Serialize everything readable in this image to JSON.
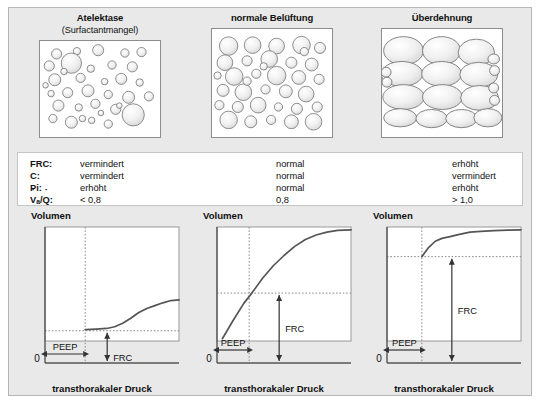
{
  "panels": [
    {
      "title": "Atelektase",
      "subtitle": "(Surfactantmangel)",
      "name": "atelectasis"
    },
    {
      "title": "normale Belüftung",
      "subtitle": "",
      "name": "normal-ventilation"
    },
    {
      "title": "Überdehnung",
      "subtitle": "",
      "name": "overdistension"
    }
  ],
  "table": {
    "rows": [
      {
        "label": "FRC:",
        "values": [
          "vermindert",
          "normal",
          "erhöht"
        ]
      },
      {
        "label": "C:",
        "values": [
          "vermindert",
          "normal",
          "vermindert"
        ]
      },
      {
        "label": "Pi:",
        "values": [
          "erhöht",
          "normal",
          "erhöht"
        ]
      },
      {
        "label": "Va/Q:",
        "values": [
          "< 0,8",
          "0,8",
          "> 1,0"
        ]
      }
    ],
    "ratio_label": {
      "v": "V",
      "a": "a",
      "slash": "/",
      "q": "Q",
      "colon": ":"
    }
  },
  "charts": [
    {
      "name": "pressure-volume-atelectasis",
      "ylabel": "Volumen",
      "xlabel": "transthorakaler Druck",
      "origin_label": "0",
      "peep_label": "PEEP",
      "frc_label": "FRC"
    },
    {
      "name": "pressure-volume-normal",
      "ylabel": "Volumen",
      "xlabel": "transthorakaler Druck",
      "origin_label": "0",
      "peep_label": "PEEP",
      "frc_label": "FRC"
    },
    {
      "name": "pressure-volume-overdistension",
      "ylabel": "Volumen",
      "xlabel": "transthorakaler Druck",
      "origin_label": "0",
      "peep_label": "PEEP",
      "frc_label": "FRC"
    }
  ],
  "chart_data": [
    {
      "type": "line",
      "title": "Atelektase",
      "xlabel": "transthorakaler Druck",
      "ylabel": "Volumen",
      "xlim": [
        0,
        1
      ],
      "ylim": [
        0,
        1
      ],
      "grid": false,
      "peep_x": 0.3,
      "frc_y": 0.09,
      "x": [
        0.3,
        0.38,
        0.46,
        0.52,
        0.58,
        0.64,
        0.7,
        0.76,
        0.82,
        0.88,
        0.94,
        1.0
      ],
      "y": [
        0.1,
        0.105,
        0.11,
        0.125,
        0.155,
        0.2,
        0.25,
        0.285,
        0.31,
        0.335,
        0.355,
        0.36
      ]
    },
    {
      "type": "line",
      "title": "normale Belüftung",
      "xlabel": "transthorakaler Druck",
      "ylabel": "Volumen",
      "xlim": [
        0,
        1
      ],
      "ylim": [
        0,
        1
      ],
      "grid": false,
      "peep_x": 0.24,
      "frc_y": 0.42,
      "x": [
        0.04,
        0.12,
        0.2,
        0.26,
        0.34,
        0.42,
        0.5,
        0.58,
        0.66,
        0.74,
        0.82,
        0.9,
        1.0
      ],
      "y": [
        0.02,
        0.18,
        0.33,
        0.42,
        0.55,
        0.66,
        0.75,
        0.83,
        0.89,
        0.93,
        0.955,
        0.97,
        0.975
      ]
    },
    {
      "type": "line",
      "title": "Überdehnung",
      "xlabel": "transthorakaler Druck",
      "ylabel": "Volumen",
      "xlim": [
        0,
        1
      ],
      "ylim": [
        0,
        1
      ],
      "grid": false,
      "peep_x": 0.26,
      "frc_y": 0.74,
      "x": [
        0.26,
        0.31,
        0.36,
        0.41,
        0.47,
        0.54,
        0.62,
        0.7,
        0.8,
        0.9,
        1.0
      ],
      "y": [
        0.74,
        0.82,
        0.875,
        0.9,
        0.915,
        0.935,
        0.955,
        0.962,
        0.968,
        0.972,
        0.975
      ]
    }
  ],
  "alveoli": {
    "atelectasis": [
      [
        18,
        14,
        5.5
      ],
      [
        40,
        11,
        4.0
      ],
      [
        63,
        10,
        6.0
      ],
      [
        92,
        13,
        4.5
      ],
      [
        110,
        12,
        5.0
      ],
      [
        10,
        27,
        5.5
      ],
      [
        34,
        24,
        11.0
      ],
      [
        55,
        30,
        4.0
      ],
      [
        78,
        26,
        4.5
      ],
      [
        100,
        28,
        5.5
      ],
      [
        16,
        42,
        6.5
      ],
      [
        44,
        40,
        5.0
      ],
      [
        70,
        44,
        3.5
      ],
      [
        88,
        41,
        6.0
      ],
      [
        108,
        45,
        4.0
      ],
      [
        12,
        57,
        3.5
      ],
      [
        30,
        56,
        5.5
      ],
      [
        52,
        54,
        6.5
      ],
      [
        74,
        58,
        4.5
      ],
      [
        96,
        61,
        6.5
      ],
      [
        20,
        70,
        6.0
      ],
      [
        42,
        72,
        4.0
      ],
      [
        60,
        68,
        5.0
      ],
      [
        82,
        74,
        5.5
      ],
      [
        101,
        80,
        12.0
      ],
      [
        14,
        84,
        4.5
      ],
      [
        34,
        88,
        6.5
      ],
      [
        56,
        86,
        3.5
      ],
      [
        74,
        90,
        4.5
      ],
      [
        118,
        60,
        5.0
      ],
      [
        26,
        33,
        3.5
      ],
      [
        86,
        70,
        3.0
      ],
      [
        46,
        84,
        3.5
      ],
      [
        66,
        78,
        3.0
      ],
      [
        6,
        48,
        3.0
      ]
    ],
    "normal": [
      [
        18,
        14,
        10.0
      ],
      [
        44,
        13,
        9.0
      ],
      [
        70,
        14,
        8.5
      ],
      [
        97,
        13,
        9.5
      ],
      [
        117,
        16,
        6.0
      ],
      [
        14,
        32,
        8.5
      ],
      [
        38,
        30,
        5.5
      ],
      [
        62,
        28,
        9.0
      ],
      [
        86,
        32,
        6.0
      ],
      [
        108,
        34,
        7.0
      ],
      [
        6,
        46,
        4.0
      ],
      [
        24,
        47,
        9.5
      ],
      [
        48,
        44,
        5.0
      ],
      [
        70,
        46,
        10.0
      ],
      [
        94,
        48,
        7.5
      ],
      [
        116,
        50,
        5.5
      ],
      [
        12,
        62,
        6.5
      ],
      [
        34,
        64,
        9.0
      ],
      [
        58,
        61,
        5.0
      ],
      [
        80,
        63,
        7.0
      ],
      [
        102,
        66,
        8.5
      ],
      [
        8,
        78,
        5.0
      ],
      [
        28,
        80,
        6.0
      ],
      [
        50,
        78,
        8.5
      ],
      [
        72,
        80,
        4.5
      ],
      [
        92,
        82,
        6.0
      ],
      [
        114,
        80,
        5.5
      ],
      [
        18,
        94,
        9.5
      ],
      [
        42,
        96,
        6.5
      ],
      [
        64,
        94,
        5.0
      ],
      [
        86,
        96,
        7.5
      ],
      [
        110,
        96,
        9.0
      ],
      [
        56,
        36,
        4.0
      ],
      [
        38,
        52,
        4.5
      ],
      [
        100,
        20,
        4.5
      ]
    ],
    "overdistension": [
      [
        26,
        18,
        24,
        17
      ],
      [
        72,
        18,
        23,
        17
      ],
      [
        114,
        20,
        22,
        16
      ],
      [
        24,
        46,
        25,
        15
      ],
      [
        72,
        46,
        24,
        15
      ],
      [
        117,
        47,
        23,
        15
      ],
      [
        26,
        74,
        25,
        15
      ],
      [
        73,
        74,
        24,
        15
      ],
      [
        118,
        75,
        23,
        15
      ],
      [
        22,
        99,
        20,
        11
      ],
      [
        60,
        100,
        19,
        11
      ],
      [
        96,
        100,
        19,
        11
      ],
      [
        128,
        99,
        17,
        11
      ],
      [
        5,
        44,
        6,
        6
      ],
      [
        6,
        56,
        6,
        6
      ],
      [
        135,
        28,
        7,
        6
      ],
      [
        136,
        42,
        6,
        6
      ],
      [
        135,
        63,
        6,
        6
      ],
      [
        136,
        78,
        6,
        6
      ]
    ]
  }
}
